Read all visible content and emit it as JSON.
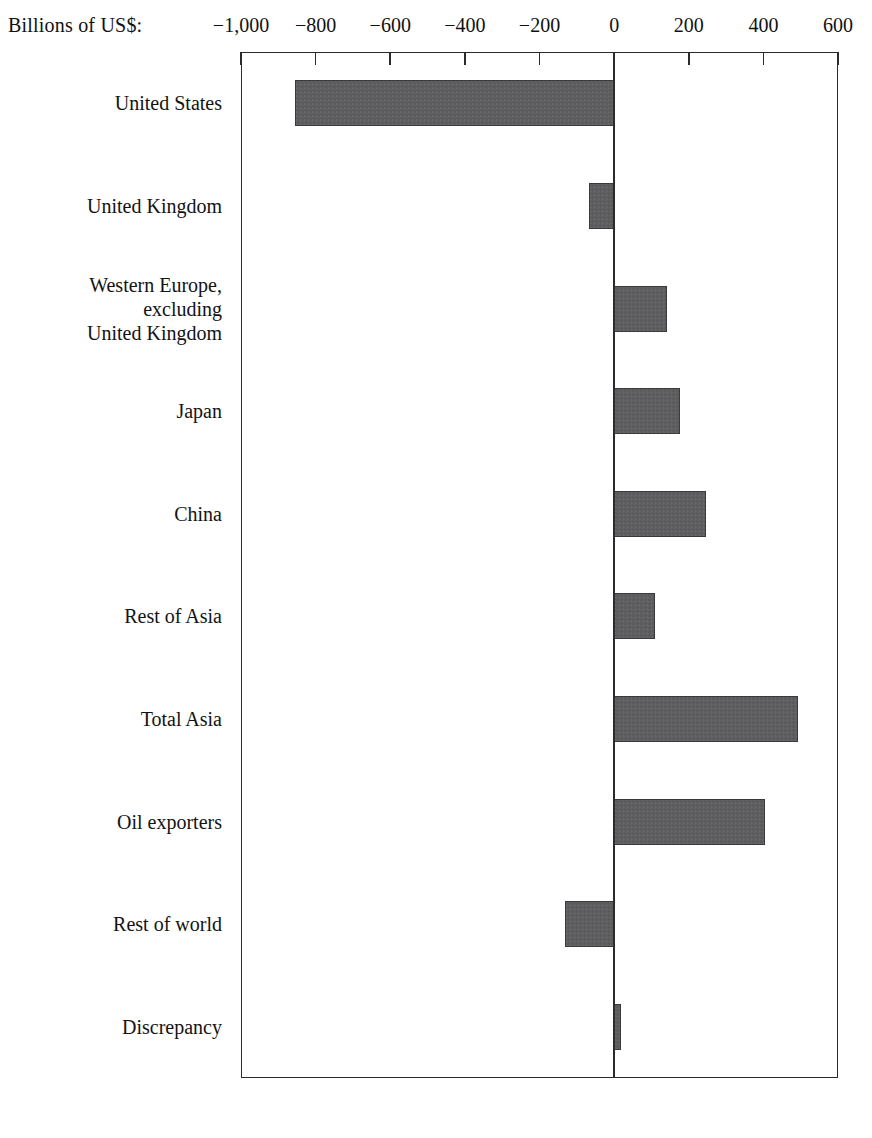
{
  "chart_data": {
    "type": "bar",
    "orientation": "horizontal",
    "title": "",
    "xlabel": "Billions of US$:",
    "ylabel": "",
    "xlim": [
      -1000,
      600
    ],
    "grid": false,
    "legend": null,
    "xticks": [
      -1000,
      -800,
      -600,
      -400,
      -200,
      0,
      200,
      400,
      600
    ],
    "xtick_labels": [
      "−1,000",
      "−800",
      "−600",
      "−400",
      "−200",
      "0",
      "200",
      "400",
      "600"
    ],
    "categories": [
      "United States",
      "United Kingdom",
      "Western Europe,\nexcluding\nUnited Kingdom",
      "Japan",
      "China",
      "Rest of Asia",
      "Total Asia",
      "Oil exporters",
      "Rest of world",
      "Discrepancy"
    ],
    "values": [
      -855,
      -67,
      142,
      177,
      247,
      110,
      493,
      405,
      -131,
      18
    ],
    "bar_color": "#5d5d5f",
    "bar_edge_color": "#3a3a3c",
    "axis_color": "#2b2b2b",
    "background_color": "#ffffff"
  },
  "axis": {
    "unit_label": "Billions of US$:"
  },
  "rows": [
    {
      "label": "United States",
      "value": -855
    },
    {
      "label": "United Kingdom",
      "value": -67
    },
    {
      "label": "Western Europe,\nexcluding\nUnited Kingdom",
      "value": 142
    },
    {
      "label": "Japan",
      "value": 177
    },
    {
      "label": "China",
      "value": 247
    },
    {
      "label": "Rest of Asia",
      "value": 110
    },
    {
      "label": "Total Asia",
      "value": 493
    },
    {
      "label": "Oil exporters",
      "value": 405
    },
    {
      "label": "Rest of world",
      "value": -131
    },
    {
      "label": "Discrepancy",
      "value": 18
    }
  ],
  "ticks": [
    {
      "label": "−1,000",
      "value": -1000
    },
    {
      "label": "−800",
      "value": -800
    },
    {
      "label": "−600",
      "value": -600
    },
    {
      "label": "−400",
      "value": -400
    },
    {
      "label": "−200",
      "value": -200
    },
    {
      "label": "0",
      "value": 0
    },
    {
      "label": "200",
      "value": 200
    },
    {
      "label": "400",
      "value": 400
    },
    {
      "label": "600",
      "value": 600
    }
  ]
}
